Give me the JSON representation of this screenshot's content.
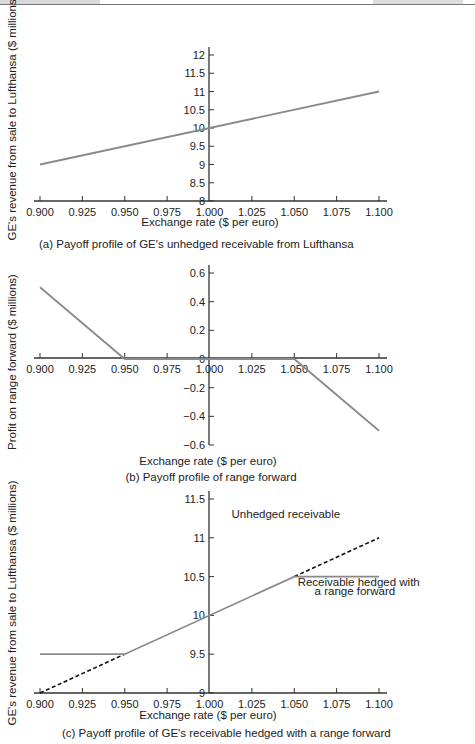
{
  "header_strip": {
    "visible": true
  },
  "chart_data": [
    {
      "id": "a",
      "type": "line",
      "caption": "(a) Payoff profile of GE's unhedged receivable from Lufthansa",
      "xlabel": "Exchange rate ($ per euro)",
      "ylabel": "GE's revenue from sale to Lufthansa ($ millions)",
      "x_ticks": [
        "0.900",
        "0.925",
        "0.950",
        "0.975",
        "1.000",
        "1.025",
        "1.050",
        "1.075",
        "1.100"
      ],
      "y_ticks": [
        "8",
        "8.5",
        "9",
        "9.5",
        "10",
        "10.5",
        "11",
        "11.5",
        "12"
      ],
      "xlim": [
        0.9,
        1.1
      ],
      "ylim": [
        8,
        12
      ],
      "series": [
        {
          "name": "Unhedged receivable",
          "style": "solid",
          "color": "#8a8a8a",
          "x": [
            0.9,
            1.1
          ],
          "y": [
            9,
            11
          ]
        }
      ]
    },
    {
      "id": "b",
      "type": "line",
      "caption": "(b) Payoff profile of range forward",
      "xlabel": "Exchange rate ($ per euro)",
      "ylabel": "Profit on range forward ($ millions)",
      "x_ticks": [
        "0.900",
        "0.925",
        "0.950",
        "0.975",
        "1.000",
        "1.025",
        "1.050",
        "1.075",
        "1.100"
      ],
      "y_ticks": [
        "−0.6",
        "−0.4",
        "−0.2",
        "0",
        "0.2",
        "0.4",
        "0.6"
      ],
      "xlim": [
        0.9,
        1.1
      ],
      "ylim": [
        -0.6,
        0.6
      ],
      "series": [
        {
          "name": "Range forward profit",
          "style": "solid",
          "color": "#8a8a8a",
          "x": [
            0.9,
            0.95,
            1.05,
            1.1
          ],
          "y": [
            0.5,
            0,
            0,
            -0.5
          ]
        }
      ]
    },
    {
      "id": "c",
      "type": "line",
      "caption": "(c) Payoff profile of GE's receivable hedged with a range forward",
      "xlabel": "Exchange rate ($ per euro)",
      "ylabel": "GE's revenue from sale to Lufthansa ($ millions)",
      "x_ticks": [
        "0.900",
        "0.925",
        "0.950",
        "0.975",
        "1.000",
        "1.025",
        "1.050",
        "1.075",
        "1.100"
      ],
      "y_ticks": [
        "9",
        "9.5",
        "10",
        "10.5",
        "11",
        "11.5"
      ],
      "xlim": [
        0.9,
        1.1
      ],
      "ylim": [
        9,
        11.5
      ],
      "series": [
        {
          "name": "Unhedged receivable",
          "style": "dashed",
          "color": "#111111",
          "x": [
            0.9,
            0.95
          ],
          "y": [
            9,
            9.5
          ],
          "x2": [
            1.05,
            1.1
          ],
          "y2": [
            10.5,
            11
          ]
        },
        {
          "name": "Receivable hedged with a range forward",
          "style": "solid",
          "color": "#8a8a8a",
          "x": [
            0.9,
            0.95,
            1.05,
            1.1
          ],
          "y": [
            9.5,
            9.5,
            10.5,
            10.5
          ]
        }
      ],
      "annotations": [
        {
          "text": "Unhedged receivable",
          "x": 1.013,
          "y": 11.25
        },
        {
          "text": "Receivable hedged with",
          "x": 1.052,
          "y": 10.38
        },
        {
          "text": "a range forward",
          "x": 1.062,
          "y": 10.26
        }
      ]
    }
  ]
}
